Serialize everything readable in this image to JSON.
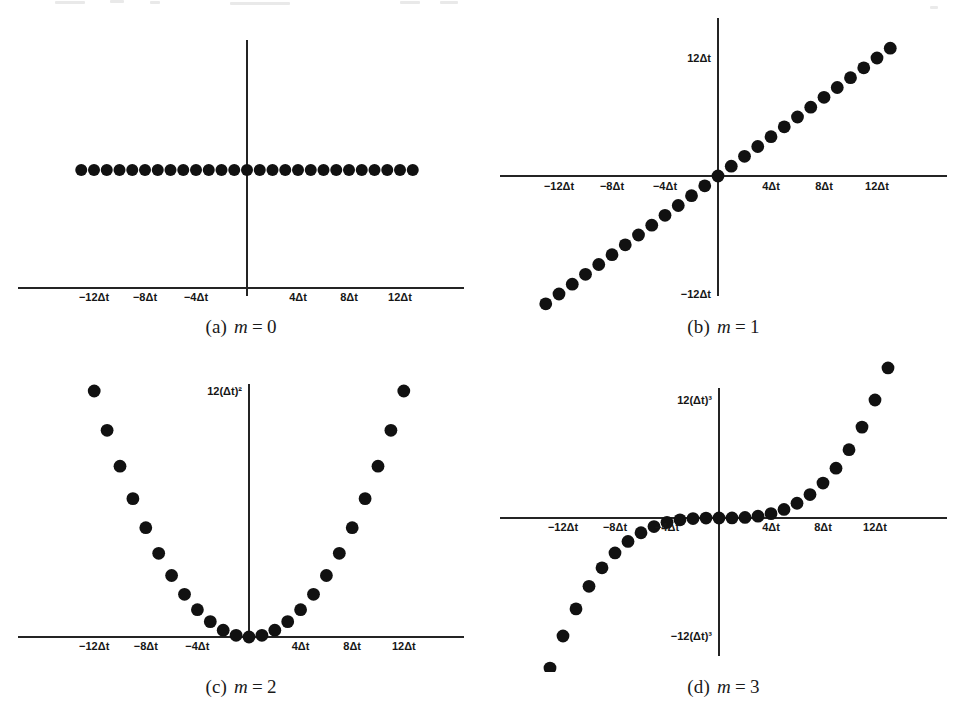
{
  "figure": {
    "dot_color": "#111111",
    "axis_color": "#242424",
    "background": "#ffffff",
    "x_index_min": -13,
    "x_index_max": 13,
    "panels": [
      {
        "id": "panel-a",
        "caption_label": "(a)",
        "caption_var": "m",
        "caption_eq": "=",
        "caption_value": "0",
        "m": 0,
        "x_tick_labels": [
          "−12Δt",
          "−8Δt",
          "−4Δt",
          "4Δt",
          "8Δt",
          "12Δt"
        ],
        "x_tick_values": [
          -12,
          -8,
          -4,
          4,
          8,
          12
        ],
        "y_axis_labels": [],
        "y_axis_label_values": []
      },
      {
        "id": "panel-b",
        "caption_label": "(b)",
        "caption_var": "m",
        "caption_eq": "=",
        "caption_value": "1",
        "m": 1,
        "x_tick_labels": [
          "−12Δt",
          "−8Δt",
          "−4Δt",
          "4Δt",
          "8Δt",
          "12Δt"
        ],
        "x_tick_values": [
          -12,
          -8,
          -4,
          4,
          8,
          12
        ],
        "y_axis_labels": [
          "12Δt",
          "−12Δt"
        ],
        "y_axis_label_values": [
          12,
          -12
        ]
      },
      {
        "id": "panel-c",
        "caption_label": "(c)",
        "caption_var": "m",
        "caption_eq": "=",
        "caption_value": "2",
        "m": 2,
        "x_tick_labels": [
          "−12Δt",
          "−8Δt",
          "−4Δt",
          "4Δt",
          "8Δt",
          "12Δt"
        ],
        "x_tick_values": [
          -12,
          -8,
          -4,
          4,
          8,
          12
        ],
        "y_axis_labels": [
          "12(Δt)²"
        ],
        "y_axis_label_values": [
          144
        ]
      },
      {
        "id": "panel-d",
        "caption_label": "(d)",
        "caption_var": "m",
        "caption_eq": "=",
        "caption_value": "3",
        "m": 3,
        "x_tick_labels": [
          "−12Δt",
          "−8Δt",
          "−4Δt",
          "4Δt",
          "8Δt",
          "12Δt"
        ],
        "x_tick_values": [
          -12,
          -8,
          -4,
          4,
          8,
          12
        ],
        "y_axis_labels": [
          "12(Δt)³",
          "−12(Δt)³"
        ],
        "y_axis_label_values": [
          1728,
          -1728
        ]
      }
    ]
  },
  "chart_data": [
    {
      "type": "scatter",
      "title": "(a) m = 0",
      "xlabel": "",
      "ylabel": "",
      "x": [
        -13,
        -12,
        -11,
        -10,
        -9,
        -8,
        -7,
        -6,
        -5,
        -4,
        -3,
        -2,
        -1,
        0,
        1,
        2,
        3,
        4,
        5,
        6,
        7,
        8,
        9,
        10,
        11,
        12,
        13
      ],
      "y": [
        1,
        1,
        1,
        1,
        1,
        1,
        1,
        1,
        1,
        1,
        1,
        1,
        1,
        1,
        1,
        1,
        1,
        1,
        1,
        1,
        1,
        1,
        1,
        1,
        1,
        1,
        1
      ],
      "xtick_labels": [
        "−12Δt",
        "−8Δt",
        "−4Δt",
        "4Δt",
        "8Δt",
        "12Δt"
      ],
      "xtick_values": [
        -12,
        -8,
        -4,
        4,
        8,
        12
      ],
      "ytick_labels": [],
      "ytick_values": [],
      "grid": false,
      "legend": "none"
    },
    {
      "type": "scatter",
      "title": "(b) m = 1",
      "xlabel": "",
      "ylabel": "",
      "x": [
        -13,
        -12,
        -11,
        -10,
        -9,
        -8,
        -7,
        -6,
        -5,
        -4,
        -3,
        -2,
        -1,
        0,
        1,
        2,
        3,
        4,
        5,
        6,
        7,
        8,
        9,
        10,
        11,
        12,
        13
      ],
      "y": [
        -13,
        -12,
        -11,
        -10,
        -9,
        -8,
        -7,
        -6,
        -5,
        -4,
        -3,
        -2,
        -1,
        0,
        1,
        2,
        3,
        4,
        5,
        6,
        7,
        8,
        9,
        10,
        11,
        12,
        13
      ],
      "xtick_labels": [
        "−12Δt",
        "−8Δt",
        "−4Δt",
        "4Δt",
        "8Δt",
        "12Δt"
      ],
      "xtick_values": [
        -12,
        -8,
        -4,
        4,
        8,
        12
      ],
      "ytick_labels": [
        "12Δt",
        "−12Δt"
      ],
      "ytick_values": [
        12,
        -12
      ],
      "grid": false,
      "legend": "none"
    },
    {
      "type": "scatter",
      "title": "(c) m = 2",
      "xlabel": "",
      "ylabel": "",
      "x": [
        -13,
        -12,
        -11,
        -10,
        -9,
        -8,
        -7,
        -6,
        -5,
        -4,
        -3,
        -2,
        -1,
        0,
        1,
        2,
        3,
        4,
        5,
        6,
        7,
        8,
        9,
        10,
        11,
        12,
        13
      ],
      "y": [
        169,
        144,
        121,
        100,
        81,
        64,
        49,
        36,
        25,
        16,
        9,
        4,
        1,
        0,
        1,
        4,
        9,
        16,
        25,
        36,
        49,
        64,
        81,
        100,
        121,
        144,
        169
      ],
      "xtick_labels": [
        "−12Δt",
        "−8Δt",
        "−4Δt",
        "4Δt",
        "8Δt",
        "12Δt"
      ],
      "xtick_values": [
        -12,
        -8,
        -4,
        4,
        8,
        12
      ],
      "ytick_labels": [
        "12(Δt)²"
      ],
      "ytick_values": [
        144
      ],
      "grid": false,
      "legend": "none"
    },
    {
      "type": "scatter",
      "title": "(d) m = 3",
      "xlabel": "",
      "ylabel": "",
      "x": [
        -13,
        -12,
        -11,
        -10,
        -9,
        -8,
        -7,
        -6,
        -5,
        -4,
        -3,
        -2,
        -1,
        0,
        1,
        2,
        3,
        4,
        5,
        6,
        7,
        8,
        9,
        10,
        11,
        12,
        13
      ],
      "y": [
        -2197,
        -1728,
        -1331,
        -1000,
        -729,
        -512,
        -343,
        -216,
        -125,
        -64,
        -27,
        -8,
        -1,
        0,
        1,
        8,
        27,
        64,
        125,
        216,
        343,
        512,
        729,
        1000,
        1331,
        1728,
        2197
      ],
      "xtick_labels": [
        "−12Δt",
        "−8Δt",
        "−4Δt",
        "4Δt",
        "8Δt",
        "12Δt"
      ],
      "xtick_values": [
        -12,
        -8,
        -4,
        4,
        8,
        12
      ],
      "ytick_labels": [
        "12(Δt)³",
        "−12(Δt)³"
      ],
      "ytick_values": [
        1728,
        -1728
      ],
      "grid": false,
      "legend": "none"
    }
  ]
}
